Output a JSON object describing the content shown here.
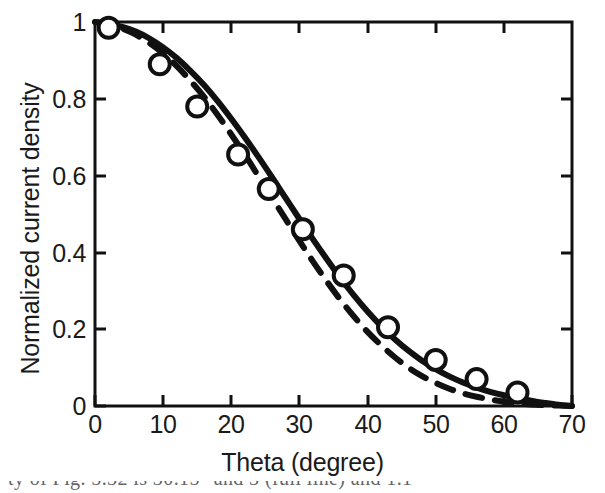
{
  "figure": {
    "background": "#ffffff",
    "ink_color": "#111111"
  },
  "axes": {
    "x_ticks": [
      "0",
      "10",
      "20",
      "30",
      "40",
      "50",
      "60",
      "70"
    ],
    "y_ticks": [
      "0",
      "0.2",
      "0.4",
      "0.6",
      "0.8",
      "1"
    ]
  },
  "caption_fragment": "ty of Fig.  5.32  is  30.15°  and 3 (full line) and 1.1",
  "chart_data": {
    "type": "line",
    "title": "",
    "subtitle": "",
    "xlabel": "Theta (degree)",
    "ylabel": "Normalized current density",
    "xlim": [
      0,
      70
    ],
    "ylim": [
      0,
      1
    ],
    "xticks": [
      0,
      10,
      20,
      30,
      40,
      50,
      60,
      70
    ],
    "yticks": [
      0,
      0.2,
      0.4,
      0.6,
      0.8,
      1
    ],
    "grid": false,
    "legend": "none",
    "series": [
      {
        "name": "model-solid",
        "style": "solid",
        "color": "#111111",
        "x": [
          0,
          2,
          4,
          6,
          8,
          10,
          12,
          14,
          16,
          18,
          20,
          22,
          24,
          26,
          28,
          30,
          32,
          34,
          36,
          38,
          40,
          42,
          44,
          46,
          48,
          50,
          52,
          54,
          56,
          58,
          60,
          62,
          64,
          66,
          68,
          70
        ],
        "y": [
          1.0,
          0.995,
          0.987,
          0.975,
          0.957,
          0.934,
          0.906,
          0.873,
          0.836,
          0.794,
          0.748,
          0.699,
          0.648,
          0.595,
          0.541,
          0.487,
          0.434,
          0.383,
          0.334,
          0.288,
          0.246,
          0.208,
          0.174,
          0.144,
          0.118,
          0.096,
          0.077,
          0.061,
          0.048,
          0.037,
          0.028,
          0.021,
          0.014,
          0.008,
          0.003,
          0.0
        ]
      },
      {
        "name": "theory-dashed",
        "style": "dashed",
        "color": "#111111",
        "x": [
          0,
          2,
          4,
          6,
          8,
          10,
          12,
          14,
          16,
          18,
          20,
          22,
          24,
          26,
          28,
          30,
          32,
          34,
          36,
          38,
          40,
          42,
          44,
          46,
          48,
          50,
          52,
          54,
          56,
          58,
          60,
          62,
          64,
          66,
          68,
          70
        ],
        "y": [
          1.0,
          0.994,
          0.983,
          0.967,
          0.945,
          0.918,
          0.885,
          0.847,
          0.805,
          0.758,
          0.707,
          0.654,
          0.598,
          0.542,
          0.486,
          0.43,
          0.376,
          0.325,
          0.277,
          0.233,
          0.193,
          0.158,
          0.127,
          0.1,
          0.078,
          0.06,
          0.045,
          0.033,
          0.024,
          0.017,
          0.011,
          0.007,
          0.004,
          0.002,
          0.001,
          0.0
        ]
      }
    ],
    "markers": {
      "name": "measured-points",
      "style": "open-circle",
      "color": "#111111",
      "x": [
        2.0,
        9.5,
        15.0,
        21.0,
        25.5,
        30.5,
        36.5,
        43.0,
        50.0,
        56.0,
        62.0
      ],
      "y": [
        0.985,
        0.89,
        0.78,
        0.655,
        0.565,
        0.46,
        0.34,
        0.205,
        0.12,
        0.07,
        0.035
      ]
    }
  }
}
